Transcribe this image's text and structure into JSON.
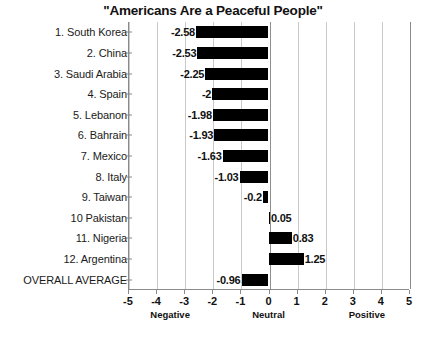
{
  "chart_data": {
    "type": "bar",
    "orientation": "horizontal",
    "title": "\"Americans Are a Peaceful People\"",
    "xlabel": "",
    "ylabel": "",
    "xlim": [
      -5,
      5
    ],
    "xticks": [
      -5,
      -4,
      -3,
      -2,
      -1,
      0,
      1,
      2,
      3,
      4,
      5
    ],
    "xtick_labels": [
      "-5",
      "-4",
      "-3",
      "-2",
      "-1",
      "0",
      "1",
      "2",
      "3",
      "4",
      "5"
    ],
    "grid": true,
    "legend": false,
    "bar_color": "#000000",
    "categories": [
      "1. South Korea",
      "2. China",
      "3. Saudi Arabia",
      "4. Spain",
      "5. Lebanon",
      "6. Bahrain",
      "7. Mexico",
      "8. Italy",
      "9. Taiwan",
      "10 Pakistan",
      "11. Nigeria",
      "12. Argentina",
      "OVERALL AVERAGE"
    ],
    "values": [
      -2.58,
      -2.53,
      -2.25,
      -2,
      -1.98,
      -1.93,
      -1.63,
      -1.03,
      -0.2,
      0.05,
      0.83,
      1.25,
      -0.96
    ],
    "value_labels": [
      "-2.58",
      "-2.53",
      "-2.25",
      "-2",
      "-1.98",
      "-1.93",
      "-1.63",
      "-1.03",
      "-0.2",
      "0.05",
      "0.83",
      "1.25",
      "-0.96"
    ],
    "zone_annotations": [
      {
        "label": "Negative",
        "at": -3.5
      },
      {
        "label": "Neutral",
        "at": 0
      },
      {
        "label": "Positive",
        "at": 3.5
      }
    ]
  }
}
